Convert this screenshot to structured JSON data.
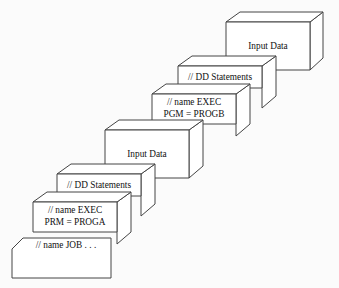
{
  "diagram": {
    "type": "isometric-block-stack",
    "background_color": "#fbfbfb",
    "line_color": "#444444",
    "face_color": "#ffffff",
    "text_color": "#111111",
    "blocks": [
      {
        "id": "input-data-top",
        "label": "Input Data",
        "lines": [
          "Input Data"
        ],
        "order": 6,
        "position": "top-right",
        "style": "3d-box"
      },
      {
        "id": "dd-statements-upper",
        "label": "// DD Statements",
        "lines": [
          "// DD Statements"
        ],
        "order": 5,
        "position": "upper",
        "style": "3d-box"
      },
      {
        "id": "exec-progb",
        "label": "// name EXEC PGM = PROGB",
        "lines": [
          "// name EXEC",
          "PGM = PROGB"
        ],
        "order": 4,
        "position": "upper-middle",
        "style": "3d-box"
      },
      {
        "id": "input-data-middle",
        "label": "Input Data",
        "lines": [
          "Input Data"
        ],
        "order": 3,
        "position": "middle",
        "style": "3d-box"
      },
      {
        "id": "dd-statements-lower",
        "label": "// DD Statements",
        "lines": [
          "// DD Statements"
        ],
        "order": 2,
        "position": "lower-middle",
        "style": "3d-box"
      },
      {
        "id": "exec-proga",
        "label": "// name EXEC PRM = PROGA",
        "lines": [
          "// name EXEC",
          "PRM = PROGA"
        ],
        "order": 1,
        "position": "lower",
        "style": "3d-box"
      },
      {
        "id": "job-card",
        "label": "// name JOB . . .",
        "lines": [
          "// name JOB . . ."
        ],
        "order": 0,
        "position": "bottom-left",
        "style": "beveled-card"
      }
    ]
  }
}
